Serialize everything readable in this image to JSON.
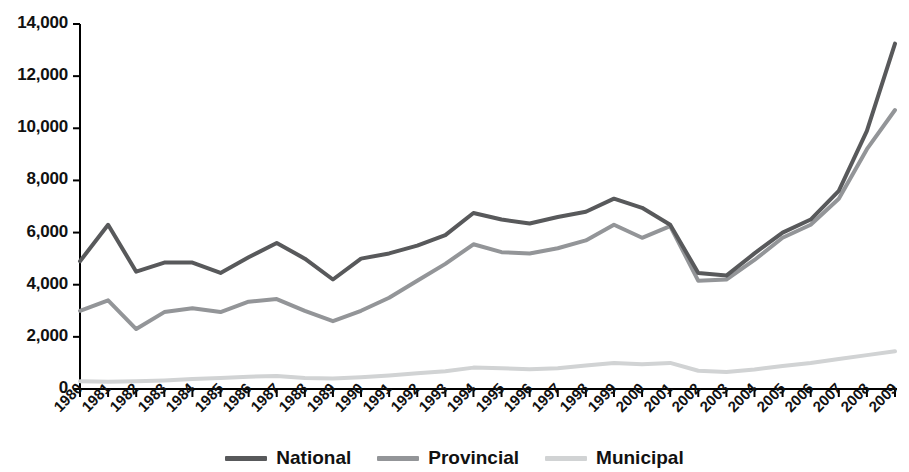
{
  "chart_data": {
    "type": "line",
    "title": "",
    "subtitle": "",
    "xlabel": "",
    "ylabel": "",
    "grid": false,
    "legend_position": "bottom",
    "xlim": [
      1980,
      2009
    ],
    "ylim": [
      0,
      14000
    ],
    "ytick_values": [
      0,
      2000,
      4000,
      6000,
      8000,
      10000,
      12000,
      14000
    ],
    "ytick_labels": [
      "0",
      "2,000",
      "4,000",
      "6,000",
      "8,000",
      "10,000",
      "12,000",
      "14,000"
    ],
    "categories": [
      "1980",
      "1981",
      "1982",
      "1983",
      "1984",
      "1985",
      "1986",
      "1987",
      "1988",
      "1989",
      "1990",
      "1991",
      "1992",
      "1993",
      "1994",
      "1995",
      "1996",
      "1997",
      "1998",
      "1999",
      "2000",
      "2001",
      "2002",
      "2003",
      "2004",
      "2005",
      "2006",
      "2007",
      "2008",
      "2009"
    ],
    "series": [
      {
        "name": "National",
        "color": "#58595b",
        "width": 4,
        "values": [
          4900,
          6300,
          4500,
          4850,
          4850,
          4450,
          5050,
          5600,
          5000,
          4200,
          5000,
          5200,
          5500,
          5900,
          6750,
          6500,
          6350,
          6600,
          6800,
          7300,
          6950,
          6300,
          4450,
          4350,
          5200,
          6000,
          6500,
          7600,
          9900,
          13250
        ]
      },
      {
        "name": "Provincial",
        "color": "#939598",
        "width": 4,
        "values": [
          3000,
          3400,
          2300,
          2950,
          3100,
          2950,
          3350,
          3450,
          3000,
          2600,
          3000,
          3500,
          4150,
          4800,
          5550,
          5250,
          5200,
          5400,
          5700,
          6300,
          5800,
          6250,
          4150,
          4200,
          4950,
          5800,
          6300,
          7300,
          9200,
          10700
        ]
      },
      {
        "name": "Municipal",
        "color": "#d1d3d4",
        "width": 4,
        "values": [
          300,
          280,
          300,
          330,
          380,
          420,
          470,
          500,
          420,
          400,
          450,
          520,
          600,
          680,
          820,
          800,
          760,
          800,
          900,
          1000,
          950,
          1000,
          700,
          650,
          750,
          880,
          1000,
          1150,
          1300,
          1450
        ]
      }
    ]
  },
  "legend": {
    "items": [
      {
        "label": "National"
      },
      {
        "label": "Provincial"
      },
      {
        "label": "Municipal"
      }
    ]
  },
  "axis": {
    "color": "#000000"
  }
}
